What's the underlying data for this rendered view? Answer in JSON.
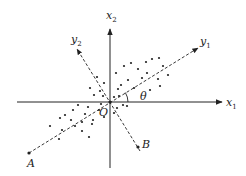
{
  "diagram": {
    "title": "",
    "axes": {
      "x1": {
        "label": "x",
        "subscript": "1"
      },
      "x2": {
        "label": "x",
        "subscript": "2"
      },
      "y1": {
        "label": "y",
        "subscript": "1"
      },
      "y2": {
        "label": "y",
        "subscript": "2"
      }
    },
    "origin_label": "O",
    "angle_label": "θ",
    "point_A_label": "A",
    "point_B_label": "B",
    "colors": {
      "line": "#222222",
      "background": "#ffffff"
    },
    "scatter_points": [
      [
        124,
        66
      ],
      [
        131,
        63
      ],
      [
        138,
        69
      ],
      [
        146,
        62
      ],
      [
        152,
        59
      ],
      [
        159,
        58
      ],
      [
        163,
        66
      ],
      [
        168,
        75
      ],
      [
        158,
        79
      ],
      [
        147,
        73
      ],
      [
        142,
        78
      ],
      [
        128,
        80
      ],
      [
        121,
        85
      ],
      [
        134,
        88
      ],
      [
        150,
        90
      ],
      [
        160,
        86
      ],
      [
        116,
        73
      ],
      [
        118,
        89
      ],
      [
        104,
        83
      ],
      [
        97,
        77
      ],
      [
        90,
        88
      ],
      [
        94,
        95
      ],
      [
        103,
        96
      ],
      [
        100,
        91
      ],
      [
        114,
        97
      ],
      [
        119,
        96
      ],
      [
        123,
        105
      ],
      [
        127,
        106
      ],
      [
        117,
        108
      ],
      [
        114,
        113
      ],
      [
        88,
        107
      ],
      [
        78,
        105
      ],
      [
        73,
        110
      ],
      [
        85,
        114
      ],
      [
        65,
        115
      ],
      [
        60,
        118
      ],
      [
        71,
        120
      ],
      [
        82,
        122
      ],
      [
        93,
        120
      ],
      [
        99,
        110
      ],
      [
        104,
        117
      ],
      [
        62,
        130
      ],
      [
        75,
        126
      ],
      [
        82,
        131
      ],
      [
        89,
        137
      ],
      [
        59,
        139
      ],
      [
        50,
        126
      ],
      [
        92,
        124
      ],
      [
        101,
        104
      ]
    ]
  }
}
